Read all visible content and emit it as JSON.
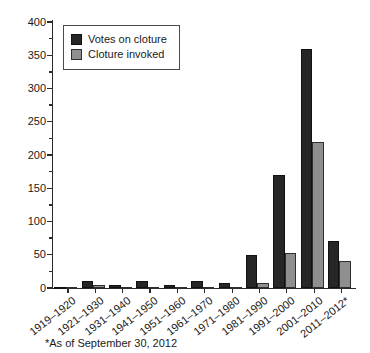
{
  "chart_data": {
    "type": "bar",
    "title": "",
    "categories": [
      "1919–1920",
      "1921–1930",
      "1931–1940",
      "1941–1950",
      "1951–1960",
      "1961–1970",
      "1971–1980",
      "1981–1990",
      "1991–2000",
      "2001–2010",
      "2011–2012*"
    ],
    "series": [
      {
        "name": "Votes on cloture",
        "color": "#262626",
        "values": [
          2,
          10,
          5,
          10,
          5,
          10,
          7,
          50,
          170,
          360,
          70
        ]
      },
      {
        "name": "Cloture invoked",
        "color": "#8f8f8f",
        "values": [
          1,
          4,
          2,
          2,
          1,
          2,
          1,
          8,
          52,
          220,
          40
        ]
      }
    ],
    "xlabel": "",
    "ylabel": "",
    "ylim": [
      0,
      400
    ],
    "y_major_step": 50,
    "y_minor_step": 25,
    "y_tick_labels": [
      "0",
      "50",
      "100",
      "150",
      "200",
      "250",
      "300",
      "350",
      "400"
    ],
    "grid": "off",
    "legend_position": "top-left",
    "footnote": "*As of September 30, 2012"
  },
  "colors": {
    "background": "#ffffff",
    "axis": "#2b2b2b",
    "bar_dark": "#262626",
    "bar_gray": "#8f8f8f",
    "text": "#1a1a1a"
  }
}
